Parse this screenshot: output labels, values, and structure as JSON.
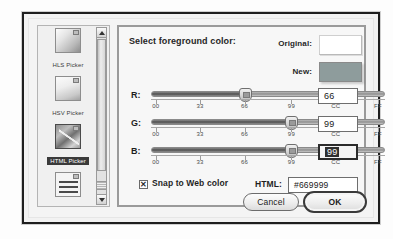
{
  "dialog": {
    "title": "Select foreground color:",
    "pickers": [
      {
        "label": "HLS Picker",
        "icon": "hls-gradient-icon",
        "selected": false
      },
      {
        "label": "HSV Picker",
        "icon": "hsv-gradient-icon",
        "selected": false
      },
      {
        "label": "HTML Picker",
        "icon": "html-gradient-icon",
        "selected": true
      },
      {
        "label": "RGB Picker",
        "icon": "rgb-sliders-icon",
        "selected": false
      }
    ],
    "scrollbar": {
      "up_arrow": "scroll-up-arrow-icon",
      "down_arrow": "scroll-down-arrow-icon"
    },
    "preview": {
      "original_label": "Original:",
      "original_color": "#ffffff",
      "new_label": "New:",
      "new_color": "#8e9c9c"
    },
    "channels": [
      {
        "name": "R:",
        "value": "66",
        "position_pct": 40,
        "focused": false,
        "ticks": [
          "00",
          "33",
          "66",
          "99",
          "CC",
          "FF"
        ]
      },
      {
        "name": "G:",
        "value": "99",
        "position_pct": 60,
        "focused": false,
        "ticks": [
          "00",
          "33",
          "66",
          "99",
          "CC",
          "FF"
        ]
      },
      {
        "name": "B:",
        "value": "99",
        "position_pct": 60,
        "focused": true,
        "ticks": [
          "00",
          "33",
          "66",
          "99",
          "CC",
          "FF"
        ]
      }
    ],
    "snap": {
      "label": "Snap to Web color",
      "checked": true,
      "check_glyph": "✕"
    },
    "html": {
      "label": "HTML:",
      "value": "#669999"
    },
    "buttons": {
      "cancel": "Cancel",
      "ok": "OK"
    }
  }
}
